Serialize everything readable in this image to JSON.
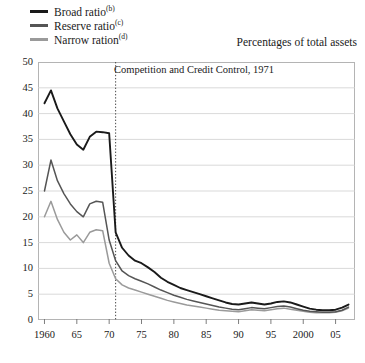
{
  "legend": {
    "position": "top-left",
    "items": [
      {
        "label": "Broad ratio",
        "note": "(b)",
        "color": "#1a1a1a"
      },
      {
        "label": "Reserve ratio",
        "note": "(c)",
        "color": "#555555"
      },
      {
        "label": "Narrow ration",
        "note": "(d)",
        "color": "#9a9a9a"
      }
    ]
  },
  "units_note": "Percentages of total assets",
  "annotation": {
    "text": "Competition and Credit Control, 1971",
    "year": 1971
  },
  "chart_data": {
    "type": "line",
    "title": "",
    "subtitle": "Percentages of total assets",
    "xlabel": "",
    "ylabel": "",
    "xlim": [
      1959,
      2008
    ],
    "ylim": [
      0,
      50
    ],
    "ytick_values": [
      0,
      5,
      10,
      15,
      20,
      25,
      30,
      35,
      40,
      45,
      50
    ],
    "ytick_labels": [
      "0",
      "5",
      "10",
      "15",
      "20",
      "25",
      "30",
      "35",
      "40",
      "45",
      "50"
    ],
    "xtick_values": [
      1960,
      1965,
      1970,
      1975,
      1980,
      1985,
      1990,
      1995,
      2000,
      2005
    ],
    "xtick_labels": [
      "1960",
      "65",
      "70",
      "75",
      "80",
      "85",
      "90",
      "95",
      "2000",
      "05"
    ],
    "grid": "horizontal",
    "legend_position": "top-left",
    "annotations": [
      {
        "type": "vline",
        "x": 1971,
        "style": "dotted",
        "label": "Competition and Credit Control, 1971"
      }
    ],
    "x": [
      1960,
      1961,
      1962,
      1963,
      1964,
      1965,
      1966,
      1967,
      1968,
      1969,
      1970,
      1971,
      1972,
      1973,
      1974,
      1975,
      1976,
      1977,
      1978,
      1979,
      1980,
      1981,
      1982,
      1983,
      1984,
      1985,
      1986,
      1987,
      1988,
      1989,
      1990,
      1991,
      1992,
      1993,
      1994,
      1995,
      1996,
      1997,
      1998,
      1999,
      2000,
      2001,
      2002,
      2003,
      2004,
      2005,
      2006,
      2007
    ],
    "series": [
      {
        "name": "Broad ratio",
        "note": "(b)",
        "color": "#1a1a1a",
        "values": [
          42.0,
          44.5,
          41.0,
          38.5,
          36.0,
          34.0,
          33.0,
          35.5,
          36.5,
          36.4,
          36.2,
          17.0,
          14.0,
          12.5,
          11.5,
          11.0,
          10.2,
          9.3,
          8.2,
          7.4,
          6.8,
          6.2,
          5.8,
          5.4,
          5.0,
          4.6,
          4.2,
          3.8,
          3.4,
          3.1,
          3.0,
          3.2,
          3.4,
          3.2,
          3.0,
          3.2,
          3.5,
          3.6,
          3.4,
          3.0,
          2.6,
          2.2,
          2.0,
          1.9,
          1.9,
          2.0,
          2.4,
          3.0
        ]
      },
      {
        "name": "Reserve ratio",
        "note": "(c)",
        "color": "#555555",
        "values": [
          25.0,
          31.0,
          27.0,
          24.5,
          22.5,
          21.0,
          20.0,
          22.5,
          23.0,
          22.8,
          15.5,
          11.5,
          9.5,
          8.6,
          8.0,
          7.5,
          7.0,
          6.4,
          5.8,
          5.3,
          4.8,
          4.4,
          4.0,
          3.7,
          3.4,
          3.1,
          2.8,
          2.5,
          2.3,
          2.1,
          2.0,
          2.2,
          2.4,
          2.3,
          2.2,
          2.4,
          2.6,
          2.7,
          2.5,
          2.2,
          1.9,
          1.7,
          1.6,
          1.5,
          1.5,
          1.6,
          1.9,
          2.5
        ]
      },
      {
        "name": "Narrow ration",
        "note": "(d)",
        "color": "#9a9a9a",
        "values": [
          20.0,
          23.0,
          19.5,
          17.0,
          15.5,
          16.5,
          15.0,
          17.0,
          17.5,
          17.3,
          11.0,
          8.0,
          6.8,
          6.2,
          5.8,
          5.4,
          5.0,
          4.6,
          4.2,
          3.8,
          3.5,
          3.2,
          2.9,
          2.7,
          2.5,
          2.3,
          2.1,
          1.9,
          1.8,
          1.7,
          1.6,
          1.8,
          2.0,
          1.9,
          1.8,
          2.0,
          2.2,
          2.3,
          2.1,
          1.9,
          1.7,
          1.5,
          1.4,
          1.4,
          1.4,
          1.5,
          1.8,
          2.3
        ]
      }
    ]
  }
}
